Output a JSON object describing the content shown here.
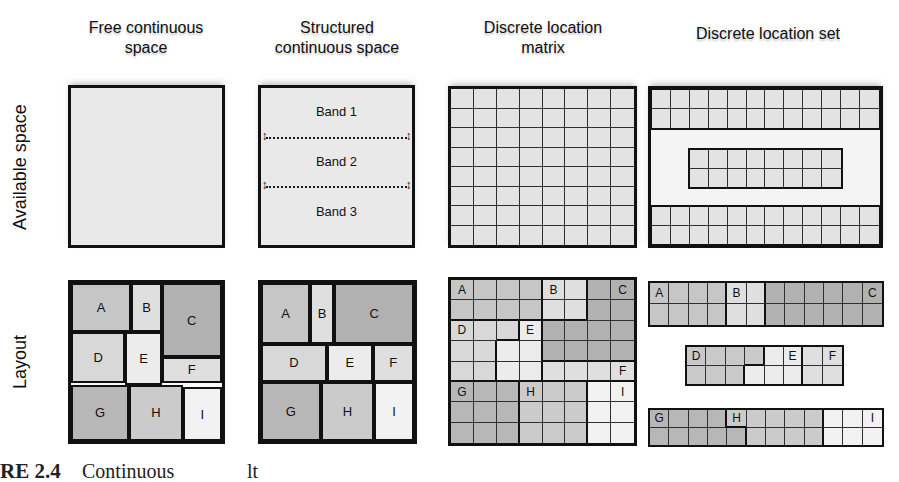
{
  "figure": {
    "row_labels": [
      "Available space",
      "Layout"
    ],
    "columns": [
      {
        "title_lines": [
          "Free continuous",
          "space"
        ]
      },
      {
        "title_lines": [
          "Structured",
          "continuous space"
        ]
      },
      {
        "title_lines": [
          "Discrete location",
          "matrix"
        ]
      },
      {
        "title_lines": [
          "Discrete location set",
          ""
        ]
      }
    ],
    "caption_fragments": [
      {
        "text": "RE 2.4",
        "x": 0
      },
      {
        "text": "Continuous",
        "x": 82
      },
      {
        "text": "lt",
        "x": 247
      }
    ]
  },
  "icons": {
    "updown_arrow": "↕"
  },
  "colors": {
    "page_bg": "#ffffff",
    "available_box_bg": "#e9e9e9",
    "available_cell": "#e3e3e3",
    "set_box_bg": "#f4f4f4",
    "layout_box_bg": "#fbfbfb",
    "grid_line": "#2f2f2f",
    "outer_border": "#111111",
    "regions": {
      "A": "#c6c6c6",
      "B": "#dfdfdf",
      "C": "#b1b1b1",
      "D": "#d8d8d8",
      "E": "#ececec",
      "F": "#dfdfdf",
      "G": "#b7b7b7",
      "H": "#cbcbcb",
      "I": "#f2f2f2"
    }
  },
  "available": {
    "structured_bands": {
      "labels": [
        "Band 1",
        "Band 2",
        "Band 3"
      ]
    },
    "matrix_grid": {
      "rows": 8,
      "cols": 8
    },
    "set_grids": {
      "top": {
        "rows": 2,
        "cols": 12
      },
      "middle": {
        "rows": 2,
        "cols": 8
      },
      "bottom": {
        "rows": 2,
        "cols": 12
      }
    }
  },
  "layout": {
    "free_blocks": [
      {
        "label": "A",
        "l": 0,
        "t": 0,
        "w": 40,
        "h": 31
      },
      {
        "label": "B",
        "l": 40,
        "t": 0,
        "w": 20,
        "h": 31
      },
      {
        "label": "C",
        "l": 60,
        "t": 0,
        "w": 40,
        "h": 47
      },
      {
        "label": "D",
        "l": 0,
        "t": 31,
        "w": 36,
        "h": 32
      },
      {
        "label": "E",
        "l": 36,
        "t": 31,
        "w": 24,
        "h": 33.5
      },
      {
        "label": "F",
        "l": 60,
        "t": 47,
        "w": 40,
        "h": 16
      },
      {
        "label": "G",
        "l": 0,
        "t": 64.5,
        "w": 38.5,
        "h": 35.5
      },
      {
        "label": "H",
        "l": 38.5,
        "t": 64.5,
        "w": 35.5,
        "h": 35.5
      },
      {
        "label": "I",
        "l": 74,
        "t": 66,
        "w": 26,
        "h": 34
      }
    ],
    "structured_blocks": [
      {
        "label": "A",
        "l": 0,
        "t": 0,
        "w": 32,
        "h": 38.5
      },
      {
        "label": "B",
        "l": 32,
        "t": 0,
        "w": 16,
        "h": 38.5
      },
      {
        "label": "C",
        "l": 48,
        "t": 0,
        "w": 52,
        "h": 38.5
      },
      {
        "label": "D",
        "l": 0,
        "t": 38.5,
        "w": 43,
        "h": 24
      },
      {
        "label": "E",
        "l": 43,
        "t": 38.5,
        "w": 30,
        "h": 24
      },
      {
        "label": "F",
        "l": 73,
        "t": 38.5,
        "w": 27,
        "h": 24
      },
      {
        "label": "G",
        "l": 0,
        "t": 62.5,
        "w": 39,
        "h": 37.5
      },
      {
        "label": "H",
        "l": 39,
        "t": 62.5,
        "w": 35,
        "h": 37.5
      },
      {
        "label": "I",
        "l": 74,
        "t": 62.5,
        "w": 26,
        "h": 37.5
      }
    ],
    "matrix_grid": {
      "cells": [
        "AAAABBCC",
        "AAAABBCC",
        "DDDECCCC",
        "DDEECCCC",
        "DDEEFFFF",
        "GGGHHHII",
        "GGGHHHII",
        "GGGHHHII"
      ],
      "labels": {
        "A": [
          0,
          0
        ],
        "B": [
          0,
          4
        ],
        "C": [
          0,
          7
        ],
        "D": [
          2,
          0
        ],
        "E": [
          2,
          3
        ],
        "F": [
          4,
          7
        ],
        "G": [
          5,
          0
        ],
        "H": [
          5,
          3
        ],
        "I": [
          5,
          7
        ]
      }
    },
    "set_grids": {
      "top": {
        "cells": [
          "AAAABBCCCCCC",
          "AAAABBCCCCCC"
        ],
        "labels": {
          "A": [
            0,
            0
          ],
          "B": [
            0,
            4
          ],
          "C": [
            0,
            11
          ]
        }
      },
      "middle": {
        "cells": [
          "DDDDEEFF",
          "DDDEEEFF"
        ],
        "labels": {
          "D": [
            0,
            0
          ],
          "E": [
            0,
            5
          ],
          "F": [
            0,
            7
          ]
        },
        "palette_overrides": {
          "D": "#c9c9c9"
        }
      },
      "bottom": {
        "cells": [
          "GGGGHHHHHIII",
          "GGGGGHHHHIII"
        ],
        "labels": {
          "G": [
            0,
            0
          ],
          "H": [
            0,
            4
          ],
          "I": [
            0,
            11
          ]
        }
      }
    }
  }
}
